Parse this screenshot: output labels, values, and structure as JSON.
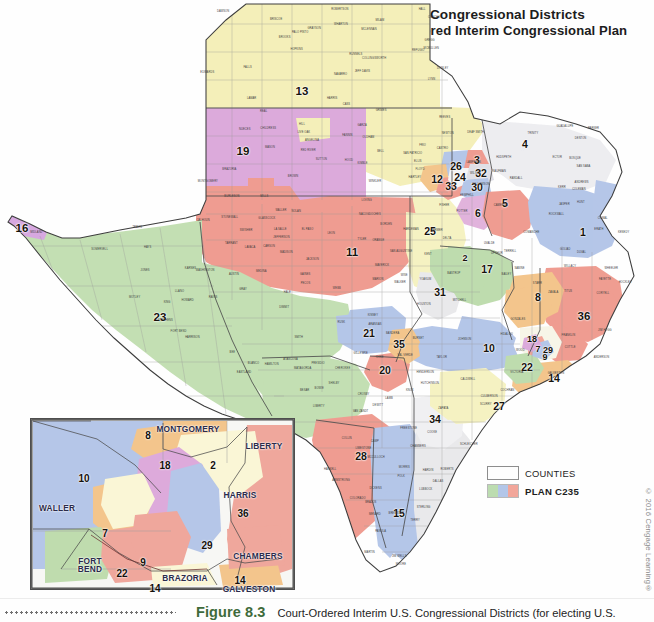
{
  "figure": {
    "title_line1": "U.S. Congressional Districts",
    "title_line2": "Court–Ordered Interim Congressional Plan",
    "figure_number": "Figure 8.3",
    "caption": "Court-Ordered Interim U.S. Congressional Districts (for electing U.S.",
    "copyright": "© 2016 Cengage Learning®"
  },
  "legend": {
    "items": [
      {
        "label": "COUNTIES",
        "swatch": "counties-outline",
        "bold": false
      },
      {
        "label": "PLAN C235",
        "swatch": "plan-gradient",
        "bold": true
      }
    ]
  },
  "colors": {
    "panhandle_yellow": "#f4efb9",
    "lubbock_purple": "#ddaadb",
    "west_green": "#c4dfb3",
    "midland_salmon": "#ef9d91",
    "elpaso_violet": "#d7a8e0",
    "central_cream": "#f6f2c2",
    "blue": "#b5c6e8",
    "pink_red": "#efa79c",
    "gray_white": "#e9e9ec",
    "orange": "#f3c58c",
    "mint": "#bfdcae",
    "caption_green": "#3e6b3b",
    "border": "#8d8d8d"
  },
  "main_map": {
    "name": "Texas congressional districts map",
    "districts": [
      {
        "number": "1",
        "x": 583,
        "y": 232,
        "size": "md"
      },
      {
        "number": "2",
        "x": 465,
        "y": 258,
        "size": "sm"
      },
      {
        "number": "3",
        "x": 477,
        "y": 160,
        "size": "md"
      },
      {
        "number": "4",
        "x": 525,
        "y": 144,
        "size": "md"
      },
      {
        "number": "5",
        "x": 505,
        "y": 203,
        "size": "md"
      },
      {
        "number": "6",
        "x": 478,
        "y": 213,
        "size": "md"
      },
      {
        "number": "7",
        "x": 538,
        "y": 349,
        "size": "sm"
      },
      {
        "number": "8",
        "x": 538,
        "y": 297,
        "size": "md"
      },
      {
        "number": "9",
        "x": 545,
        "y": 357,
        "size": "sm"
      },
      {
        "number": "10",
        "x": 489,
        "y": 348,
        "size": "md"
      },
      {
        "number": "11",
        "x": 352,
        "y": 253,
        "size": "lg"
      },
      {
        "number": "12",
        "x": 437,
        "y": 179,
        "size": "md"
      },
      {
        "number": "13",
        "x": 302,
        "y": 92,
        "size": "lg"
      },
      {
        "number": "14",
        "x": 554,
        "y": 378,
        "size": "md"
      },
      {
        "number": "15",
        "x": 399,
        "y": 513,
        "size": "md"
      },
      {
        "number": "16",
        "x": 22,
        "y": 229,
        "size": "lg"
      },
      {
        "number": "17",
        "x": 487,
        "y": 269,
        "size": "md"
      },
      {
        "number": "18",
        "x": 532,
        "y": 339,
        "size": "sm"
      },
      {
        "number": "19",
        "x": 243,
        "y": 152,
        "size": "lg"
      },
      {
        "number": "20",
        "x": 385,
        "y": 370,
        "size": "md"
      },
      {
        "number": "21",
        "x": 369,
        "y": 333,
        "size": "md"
      },
      {
        "number": "22",
        "x": 527,
        "y": 367,
        "size": "md"
      },
      {
        "number": "23",
        "x": 160,
        "y": 318,
        "size": "lg"
      },
      {
        "number": "24",
        "x": 460,
        "y": 177,
        "size": "md"
      },
      {
        "number": "25",
        "x": 430,
        "y": 231,
        "size": "md"
      },
      {
        "number": "26",
        "x": 456,
        "y": 166,
        "size": "md"
      },
      {
        "number": "27",
        "x": 499,
        "y": 406,
        "size": "md"
      },
      {
        "number": "28",
        "x": 361,
        "y": 456,
        "size": "md"
      },
      {
        "number": "29",
        "x": 548,
        "y": 350,
        "size": "sm"
      },
      {
        "number": "30",
        "x": 477,
        "y": 187,
        "size": "md"
      },
      {
        "number": "31",
        "x": 440,
        "y": 292,
        "size": "md"
      },
      {
        "number": "32",
        "x": 481,
        "y": 173,
        "size": "md"
      },
      {
        "number": "33",
        "x": 451,
        "y": 186,
        "size": "md"
      },
      {
        "number": "34",
        "x": 435,
        "y": 419,
        "size": "md"
      },
      {
        "number": "35",
        "x": 399,
        "y": 344,
        "size": "md"
      },
      {
        "number": "36",
        "x": 584,
        "y": 317,
        "size": "lg"
      }
    ]
  },
  "inset_map": {
    "name": "Houston metro area inset",
    "districts": [
      {
        "number": "8",
        "x": 148,
        "y": 435
      },
      {
        "number": "18",
        "x": 165,
        "y": 465
      },
      {
        "number": "2",
        "x": 213,
        "y": 465
      },
      {
        "number": "10",
        "x": 84,
        "y": 478
      },
      {
        "number": "36",
        "x": 243,
        "y": 513
      },
      {
        "number": "7",
        "x": 105,
        "y": 533
      },
      {
        "number": "29",
        "x": 207,
        "y": 545
      },
      {
        "number": "9",
        "x": 143,
        "y": 562
      },
      {
        "number": "22",
        "x": 122,
        "y": 573
      },
      {
        "number": "14",
        "x": 155,
        "y": 588
      },
      {
        "number": "14",
        "x": 240,
        "y": 580
      }
    ],
    "counties": [
      {
        "name": "MONTGOMERY",
        "x": 188,
        "y": 429
      },
      {
        "name": "LIBERTY",
        "x": 264,
        "y": 446
      },
      {
        "name": "HARRIS",
        "x": 240,
        "y": 495
      },
      {
        "name": "CHAMBERS",
        "x": 258,
        "y": 556
      },
      {
        "name": "WALLER",
        "x": 57,
        "y": 508
      },
      {
        "name": "FORT\nBEND",
        "x": 90,
        "y": 565
      },
      {
        "name": "BRAZORIA",
        "x": 185,
        "y": 578
      },
      {
        "name": "GALVESTON",
        "x": 249,
        "y": 589
      }
    ]
  },
  "county_labels_main": [
    "HARTLEY",
    "MOORE",
    "HUTCHINSON",
    "ROBERTS",
    "HEMPHILL",
    "OLDHAM",
    "POTTER",
    "CARSON",
    "GRAY",
    "WHEELER",
    "DEAF SMITH",
    "RANDALL",
    "ARMSTRONG",
    "DONLEY",
    "COLLINGSWORTH",
    "PARMER",
    "CASTRO",
    "SWISHER",
    "BRISCOE",
    "HALL",
    "CHILDRESS",
    "BAILEY",
    "LAMB",
    "HALE",
    "FLOYD",
    "MOTLEY",
    "COTTLE",
    "HARDEMAN",
    "COCHRAN",
    "HOCKLEY",
    "LUBBOCK",
    "CROSBY",
    "DICKENS",
    "KING",
    "KNOX",
    "YOAKUM",
    "TERRY",
    "LYNN",
    "GARZA",
    "KENT",
    "STONEWALL",
    "HASKELL",
    "GAINES",
    "DAWSON",
    "BORDEN",
    "SCURRY",
    "FISHER",
    "JONES",
    "ANDREWS",
    "MARTIN",
    "HOWARD",
    "MITCHELL",
    "NOLAN",
    "TAYLOR",
    "LOVING",
    "WINKLER",
    "ECTOR",
    "MIDLAND",
    "GLASSCOCK",
    "STERLING",
    "COKE",
    "RUNNELS",
    "HUDSPETH",
    "CULBERSON",
    "REEVES",
    "PECOS",
    "BREWSTER",
    "PRESIDIO",
    "JEFF DAVIS",
    "TERRELL",
    "VAL VERDE",
    "EDWARDS",
    "KINNEY",
    "UVALDE",
    "MEDINA",
    "BEXAR",
    "WEBB",
    "ZAPATA",
    "STARR",
    "HIDALGO",
    "CAMERON",
    "WILLACY",
    "KENEDY",
    "BROOKS",
    "DUVAL",
    "JIM WELLS",
    "NUECES",
    "SAN PATRICIO",
    "ARANSAS",
    "REFUGIO",
    "VICTORIA",
    "CALHOUN",
    "JACKSON",
    "MATAGORDA",
    "WHARTON",
    "COLORADO",
    "AUSTIN",
    "WASHINGTON",
    "FAYETTE",
    "LAVACA",
    "GONZALES",
    "DEWITT",
    "KARNES",
    "WILSON",
    "GUADALUPE",
    "COMAL",
    "HAYS",
    "TRAVIS",
    "BASTROP",
    "CALDWELL",
    "WILLIAMSON",
    "BELL",
    "CORYELL",
    "MCLENNAN",
    "FALLS",
    "LIMESTONE",
    "ROBERTSON",
    "MILAM",
    "BURLESON",
    "BRAZOS",
    "MADISON",
    "GRIMES",
    "WALKER",
    "MONTGOMERY",
    "TRINITY",
    "POLK",
    "TYLER",
    "JASPER",
    "NEWTON",
    "ORANGE",
    "JEFFERSON",
    "HARDIN",
    "LIBERTY",
    "CHAMBERS",
    "GALVESTON",
    "BRAZORIA",
    "HARRIS",
    "FORT BEND",
    "WALLER",
    "DALLAS",
    "TARRANT",
    "DENTON",
    "COLLIN",
    "ROCKWALL",
    "KAUFMAN",
    "ELLIS",
    "JOHNSON",
    "PARKER",
    "WISE",
    "COOKE",
    "GRAYSON",
    "FANNIN",
    "LAMAR",
    "RED RIVER",
    "BOWIE",
    "CASS",
    "MARION",
    "HARRISON",
    "PANOLA",
    "RUSK",
    "GREGG",
    "SMITH",
    "VAN ZANDT",
    "HENDERSON",
    "NAVARRO",
    "HILL",
    "BOSQUE",
    "HAMILTON",
    "COMANCHE",
    "ERATH",
    "HOOD",
    "SOMERVELL",
    "PALO PINTO",
    "STEPHENS",
    "EASTLAND",
    "BROWN",
    "COLEMAN",
    "CONCHO",
    "MCCULLOCH",
    "SAN SABA",
    "MILLS",
    "LAMPASAS",
    "BURNET",
    "LLANO",
    "MASON",
    "MENARD",
    "SCHLEICHER",
    "SUTTON",
    "KIMBLE",
    "GILLESPIE",
    "KERR",
    "BANDERA",
    "REAL",
    "BLANCO",
    "ANDERSON",
    "CHEROKEE",
    "NACOGDOCHES",
    "SHELBY",
    "SAN AUGUSTINE",
    "SABINE",
    "ANGELINA",
    "HOUSTON",
    "LEON",
    "FREESTONE",
    "HOPKINS",
    "HUNT",
    "RAINS",
    "WOOD",
    "UPSHUR",
    "CAMP",
    "TITUS",
    "MORRIS",
    "FRANKLIN",
    "DELTA",
    "ATASCOSA",
    "FRIO",
    "LA SALLE",
    "MCMULLEN",
    "LIVE OAK",
    "BEE",
    "GOLIAD",
    "DIMMIT",
    "ZAVALA",
    "MAVERICK",
    "JIM HOGG",
    "EL PASO"
  ]
}
